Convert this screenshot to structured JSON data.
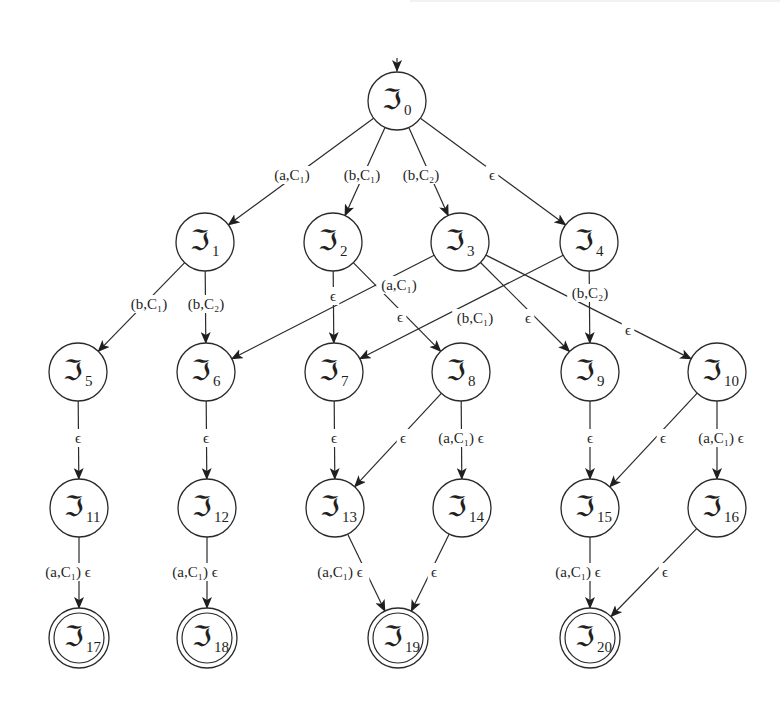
{
  "diagram": {
    "type": "state-transition-graph",
    "node_symbol": "ℑ",
    "epsilon": "ϵ",
    "start_arrow": {
      "from": [
        397,
        58
      ],
      "to": "n0"
    },
    "nodes": [
      {
        "id": "n0",
        "label": "ℑ",
        "sub": "0",
        "x": 397,
        "y": 101,
        "accepting": false
      },
      {
        "id": "n1",
        "label": "ℑ",
        "sub": "1",
        "x": 205,
        "y": 242,
        "accepting": false
      },
      {
        "id": "n2",
        "label": "ℑ",
        "sub": "2",
        "x": 333,
        "y": 242,
        "accepting": false
      },
      {
        "id": "n3",
        "label": "ℑ",
        "sub": "3",
        "x": 460,
        "y": 242,
        "accepting": false
      },
      {
        "id": "n4",
        "label": "ℑ",
        "sub": "4",
        "x": 589,
        "y": 242,
        "accepting": false
      },
      {
        "id": "n5",
        "label": "ℑ",
        "sub": "5",
        "x": 78,
        "y": 372,
        "accepting": false
      },
      {
        "id": "n6",
        "label": "ℑ",
        "sub": "6",
        "x": 206,
        "y": 372,
        "accepting": false
      },
      {
        "id": "n7",
        "label": "ℑ",
        "sub": "7",
        "x": 334,
        "y": 372,
        "accepting": false
      },
      {
        "id": "n8",
        "label": "ℑ",
        "sub": "8",
        "x": 461,
        "y": 372,
        "accepting": false
      },
      {
        "id": "n9",
        "label": "ℑ",
        "sub": "9",
        "x": 590,
        "y": 372,
        "accepting": false
      },
      {
        "id": "n10",
        "label": "ℑ",
        "sub": "10",
        "x": 717,
        "y": 372,
        "accepting": false
      },
      {
        "id": "n11",
        "label": "ℑ",
        "sub": "11",
        "x": 79,
        "y": 508,
        "accepting": false
      },
      {
        "id": "n12",
        "label": "ℑ",
        "sub": "12",
        "x": 207,
        "y": 508,
        "accepting": false
      },
      {
        "id": "n13",
        "label": "ℑ",
        "sub": "13",
        "x": 335,
        "y": 508,
        "accepting": false
      },
      {
        "id": "n14",
        "label": "ℑ",
        "sub": "14",
        "x": 462,
        "y": 508,
        "accepting": false
      },
      {
        "id": "n15",
        "label": "ℑ",
        "sub": "15",
        "x": 590,
        "y": 508,
        "accepting": false
      },
      {
        "id": "n16",
        "label": "ℑ",
        "sub": "16",
        "x": 717,
        "y": 508,
        "accepting": false
      },
      {
        "id": "n17",
        "label": "ℑ",
        "sub": "17",
        "x": 79,
        "y": 638,
        "accepting": true
      },
      {
        "id": "n18",
        "label": "ℑ",
        "sub": "18",
        "x": 207,
        "y": 638,
        "accepting": true
      },
      {
        "id": "n19",
        "label": "ℑ",
        "sub": "19",
        "x": 398,
        "y": 638,
        "accepting": true
      },
      {
        "id": "n20",
        "label": "ℑ",
        "sub": "20",
        "x": 590,
        "y": 638,
        "accepting": true
      }
    ],
    "edges": [
      {
        "from": "n0",
        "to": "n1",
        "label": "(a,C₁)",
        "lx": 292,
        "ly": 175
      },
      {
        "from": "n0",
        "to": "n2",
        "label": "(b,C₁)",
        "lx": 362,
        "ly": 175
      },
      {
        "from": "n0",
        "to": "n3",
        "label": "(b,C₂)",
        "lx": 421,
        "ly": 175
      },
      {
        "from": "n0",
        "to": "n4",
        "label": "ϵ",
        "lx": 492,
        "ly": 175
      },
      {
        "from": "n1",
        "to": "n5",
        "label": "(b,C₁)",
        "lx": 149,
        "ly": 304
      },
      {
        "from": "n1",
        "to": "n6",
        "label": "(b,C₂)",
        "lx": 206,
        "ly": 304
      },
      {
        "from": "n2",
        "to": "n7",
        "label": "ϵ",
        "lx": 333,
        "ly": 296
      },
      {
        "from": "n2",
        "to": "n8",
        "label": "ϵ",
        "lx": 400,
        "ly": 317
      },
      {
        "from": "n3",
        "to": "n6",
        "label": "(a,C₁)",
        "lx": 399,
        "ly": 285
      },
      {
        "from": "n3",
        "to": "n9",
        "label": "ϵ",
        "lx": 528,
        "ly": 318
      },
      {
        "from": "n3",
        "to": "n10",
        "label": "ϵ",
        "lx": 628,
        "ly": 330
      },
      {
        "from": "n4",
        "to": "n7",
        "label": "(b,C₁)",
        "lx": 475,
        "ly": 318
      },
      {
        "from": "n4",
        "to": "n9",
        "label": "(b,C₂)",
        "lx": 590,
        "ly": 293
      },
      {
        "from": "n5",
        "to": "n11",
        "label": "ϵ",
        "lx": 78,
        "ly": 438
      },
      {
        "from": "n6",
        "to": "n12",
        "label": "ϵ",
        "lx": 206,
        "ly": 438
      },
      {
        "from": "n7",
        "to": "n13",
        "label": "ϵ",
        "lx": 334,
        "ly": 438
      },
      {
        "from": "n8",
        "to": "n13",
        "label": "ϵ",
        "lx": 403,
        "ly": 438
      },
      {
        "from": "n8",
        "to": "n14",
        "label": "(a,C₁) ϵ",
        "lx": 461,
        "ly": 438
      },
      {
        "from": "n9",
        "to": "n15",
        "label": "ϵ",
        "lx": 590,
        "ly": 438
      },
      {
        "from": "n10",
        "to": "n15",
        "label": "ϵ",
        "lx": 663,
        "ly": 438
      },
      {
        "from": "n10",
        "to": "n16",
        "label": "(a,C₁) ϵ",
        "lx": 721,
        "ly": 438
      },
      {
        "from": "n11",
        "to": "n17",
        "label": "(a,C₁) ϵ",
        "lx": 68,
        "ly": 572
      },
      {
        "from": "n12",
        "to": "n18",
        "label": "(a,C₁) ϵ",
        "lx": 195,
        "ly": 572
      },
      {
        "from": "n13",
        "to": "n19",
        "label": "(a,C₁) ϵ",
        "lx": 340,
        "ly": 572
      },
      {
        "from": "n14",
        "to": "n19",
        "label": "ϵ",
        "lx": 434,
        "ly": 572
      },
      {
        "from": "n15",
        "to": "n20",
        "label": "(a,C₁) ϵ",
        "lx": 578,
        "ly": 572
      },
      {
        "from": "n16",
        "to": "n20",
        "label": "ϵ",
        "lx": 665,
        "ly": 572
      }
    ]
  },
  "style": {
    "stroke": "#2a2a2a",
    "background": "#ffffff",
    "node_radius": 29
  }
}
